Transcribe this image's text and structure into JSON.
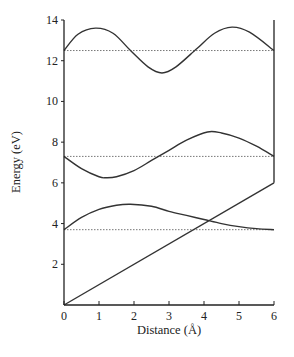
{
  "chart_data": {
    "type": "line",
    "title": "",
    "xlabel": "Distance (Å)",
    "ylabel": "Energy (eV)",
    "xlim": [
      0,
      6
    ],
    "ylim": [
      0,
      14
    ],
    "xticks": [
      "0",
      "1",
      "2",
      "3",
      "4",
      "5",
      "6"
    ],
    "yticks": [
      "2",
      "4",
      "6",
      "8",
      "10",
      "12",
      "14"
    ],
    "grid": false,
    "legend": "none",
    "series": [
      {
        "name": "linear-potential",
        "style": "solid",
        "x": [
          0,
          6
        ],
        "y": [
          0,
          6
        ]
      },
      {
        "name": "band-1",
        "style": "solid",
        "x": [
          0,
          0.5,
          1.0,
          1.5,
          1.9,
          2.5,
          3.0,
          3.5,
          4.0,
          4.5,
          5.0,
          5.5,
          6.0
        ],
        "y": [
          3.7,
          4.3,
          4.7,
          4.9,
          4.95,
          4.85,
          4.6,
          4.4,
          4.2,
          4.0,
          3.85,
          3.75,
          3.7
        ]
      },
      {
        "name": "band-2",
        "style": "solid",
        "x": [
          0,
          0.5,
          1.0,
          1.2,
          1.5,
          2.0,
          2.5,
          3.0,
          3.5,
          4.1,
          4.5,
          5.0,
          5.5,
          6.0
        ],
        "y": [
          7.3,
          6.7,
          6.3,
          6.25,
          6.3,
          6.6,
          7.1,
          7.6,
          8.1,
          8.5,
          8.45,
          8.2,
          7.8,
          7.3
        ]
      },
      {
        "name": "band-3",
        "style": "solid",
        "x": [
          0,
          0.4,
          0.9,
          1.4,
          1.9,
          2.4,
          2.8,
          3.2,
          3.8,
          4.3,
          4.8,
          5.3,
          6.0
        ],
        "y": [
          12.5,
          13.3,
          13.6,
          13.35,
          12.5,
          11.7,
          11.4,
          11.7,
          12.6,
          13.35,
          13.65,
          13.4,
          12.5
        ]
      },
      {
        "name": "reference-level-1",
        "style": "dotted",
        "x": [
          0,
          6
        ],
        "y": [
          3.7,
          3.7
        ]
      },
      {
        "name": "reference-level-2",
        "style": "dotted",
        "x": [
          0,
          6
        ],
        "y": [
          7.3,
          7.3
        ]
      },
      {
        "name": "reference-level-3",
        "style": "dotted",
        "x": [
          0,
          6
        ],
        "y": [
          12.5,
          12.5
        ]
      }
    ],
    "right_boundary": {
      "x": 6,
      "y_from": 6,
      "y_to": 14
    }
  }
}
